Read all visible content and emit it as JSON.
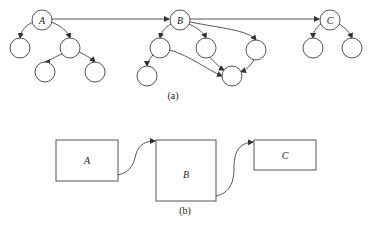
{
  "figure_a": {
    "caption": "(a)",
    "roots": [
      {
        "label": "A"
      },
      {
        "label": "B"
      },
      {
        "label": "C"
      }
    ]
  },
  "figure_b": {
    "caption": "(b)",
    "boxes": [
      {
        "label": "A"
      },
      {
        "label": "B"
      },
      {
        "label": "C"
      }
    ]
  }
}
